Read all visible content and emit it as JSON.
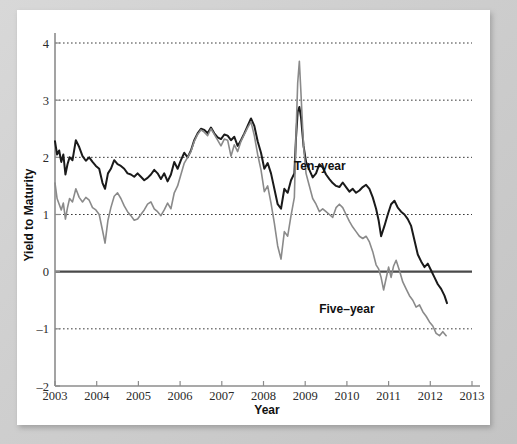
{
  "chart_data": {
    "type": "line",
    "title": "",
    "xlabel": "Year",
    "ylabel": "Yield to Maturity",
    "xlim": [
      2003,
      2013
    ],
    "ylim": [
      -2,
      4
    ],
    "grid": true,
    "gridlines_y": [
      4,
      3,
      2,
      1,
      -1
    ],
    "zero_line": 0,
    "legend_position": "inline-annotation",
    "xticks": [
      "2003",
      "2004",
      "2005",
      "2006",
      "2007",
      "2008",
      "2009",
      "2010",
      "2011",
      "2012",
      "2013"
    ],
    "xtick_values": [
      2003,
      2004,
      2005,
      2006,
      2007,
      2008,
      2009,
      2010,
      2011,
      2012,
      2013
    ],
    "yticks": [
      "4",
      "3",
      "2",
      "1",
      "0",
      "-1",
      "-2"
    ],
    "ytick_values": [
      4,
      3,
      2,
      1,
      0,
      -1,
      -2
    ],
    "series": [
      {
        "name": "Ten-year",
        "label": "Ten–year",
        "color": "#1a1a1a",
        "stroke_width": 2.0,
        "label_x": 2009.35,
        "label_y": 1.78,
        "x": [
          2003.0,
          2003.05,
          2003.1,
          2003.15,
          2003.2,
          2003.25,
          2003.3,
          2003.35,
          2003.42,
          2003.5,
          2003.58,
          2003.66,
          2003.74,
          2003.82,
          2003.9,
          2003.98,
          2004.06,
          2004.14,
          2004.2,
          2004.27,
          2004.34,
          2004.42,
          2004.5,
          2004.58,
          2004.66,
          2004.74,
          2004.82,
          2004.9,
          2004.98,
          2005.06,
          2005.14,
          2005.22,
          2005.3,
          2005.38,
          2005.46,
          2005.54,
          2005.62,
          2005.7,
          2005.78,
          2005.86,
          2005.94,
          2006.02,
          2006.1,
          2006.18,
          2006.26,
          2006.34,
          2006.42,
          2006.5,
          2006.58,
          2006.66,
          2006.74,
          2006.82,
          2006.9,
          2006.98,
          2007.06,
          2007.14,
          2007.22,
          2007.3,
          2007.38,
          2007.46,
          2007.54,
          2007.62,
          2007.7,
          2007.78,
          2007.86,
          2007.94,
          2008.02,
          2008.1,
          2008.18,
          2008.26,
          2008.34,
          2008.42,
          2008.5,
          2008.58,
          2008.66,
          2008.74,
          2008.78,
          2008.82,
          2008.86,
          2008.9,
          2008.96,
          2009.02,
          2009.1,
          2009.18,
          2009.26,
          2009.34,
          2009.42,
          2009.5,
          2009.58,
          2009.66,
          2009.74,
          2009.82,
          2009.9,
          2009.98,
          2010.06,
          2010.14,
          2010.22,
          2010.3,
          2010.38,
          2010.46,
          2010.54,
          2010.62,
          2010.7,
          2010.76,
          2010.82,
          2010.9,
          2010.98,
          2011.06,
          2011.14,
          2011.22,
          2011.3,
          2011.38,
          2011.46,
          2011.54,
          2011.62,
          2011.7,
          2011.78,
          2011.86,
          2011.94,
          2012.02,
          2012.1,
          2012.18,
          2012.26,
          2012.34,
          2012.4
        ],
        "y": [
          2.28,
          2.05,
          2.12,
          1.92,
          2.05,
          1.7,
          1.88,
          2.0,
          1.95,
          2.3,
          2.18,
          2.02,
          1.94,
          2.0,
          1.92,
          1.85,
          1.8,
          1.55,
          1.45,
          1.72,
          1.8,
          1.95,
          1.88,
          1.85,
          1.8,
          1.72,
          1.7,
          1.66,
          1.72,
          1.66,
          1.6,
          1.64,
          1.7,
          1.78,
          1.72,
          1.62,
          1.72,
          1.58,
          1.7,
          1.92,
          1.8,
          1.95,
          2.08,
          2.0,
          2.12,
          2.3,
          2.42,
          2.5,
          2.48,
          2.42,
          2.52,
          2.42,
          2.35,
          2.32,
          2.4,
          2.38,
          2.3,
          2.36,
          2.2,
          2.3,
          2.42,
          2.55,
          2.68,
          2.55,
          2.28,
          2.08,
          1.8,
          1.9,
          1.72,
          1.45,
          1.18,
          1.1,
          1.45,
          1.38,
          1.6,
          1.72,
          2.35,
          2.8,
          2.88,
          2.7,
          2.2,
          1.92,
          1.78,
          1.65,
          1.72,
          1.88,
          1.82,
          1.7,
          1.62,
          1.55,
          1.5,
          1.48,
          1.56,
          1.48,
          1.4,
          1.45,
          1.38,
          1.42,
          1.48,
          1.52,
          1.45,
          1.3,
          1.1,
          0.9,
          0.62,
          0.8,
          1.0,
          1.18,
          1.24,
          1.12,
          1.05,
          1.0,
          0.92,
          0.8,
          0.55,
          0.3,
          0.18,
          0.08,
          0.14,
          0.02,
          -0.1,
          -0.22,
          -0.3,
          -0.42,
          -0.55
        ]
      },
      {
        "name": "Five-year",
        "label": "Five–year",
        "color": "#8a8a8a",
        "stroke_width": 1.6,
        "label_x": 2010.0,
        "label_y": -0.72,
        "x": [
          2003.0,
          2003.05,
          2003.1,
          2003.15,
          2003.2,
          2003.25,
          2003.3,
          2003.35,
          2003.42,
          2003.5,
          2003.58,
          2003.66,
          2003.74,
          2003.82,
          2003.9,
          2003.98,
          2004.06,
          2004.14,
          2004.2,
          2004.27,
          2004.34,
          2004.42,
          2004.5,
          2004.58,
          2004.66,
          2004.74,
          2004.82,
          2004.9,
          2004.98,
          2005.06,
          2005.14,
          2005.22,
          2005.3,
          2005.38,
          2005.46,
          2005.54,
          2005.62,
          2005.7,
          2005.78,
          2005.86,
          2005.94,
          2006.02,
          2006.1,
          2006.18,
          2006.26,
          2006.34,
          2006.42,
          2006.5,
          2006.58,
          2006.66,
          2006.74,
          2006.82,
          2006.9,
          2006.98,
          2007.06,
          2007.14,
          2007.22,
          2007.3,
          2007.38,
          2007.46,
          2007.54,
          2007.62,
          2007.7,
          2007.78,
          2007.86,
          2007.94,
          2008.02,
          2008.1,
          2008.18,
          2008.26,
          2008.34,
          2008.42,
          2008.5,
          2008.58,
          2008.66,
          2008.74,
          2008.78,
          2008.82,
          2008.86,
          2008.9,
          2008.96,
          2009.02,
          2009.1,
          2009.18,
          2009.26,
          2009.34,
          2009.42,
          2009.5,
          2009.58,
          2009.66,
          2009.74,
          2009.82,
          2009.9,
          2009.98,
          2010.06,
          2010.14,
          2010.22,
          2010.3,
          2010.38,
          2010.46,
          2010.54,
          2010.62,
          2010.7,
          2010.76,
          2010.82,
          2010.88,
          2010.94,
          2011.0,
          2011.06,
          2011.12,
          2011.18,
          2011.26,
          2011.34,
          2011.42,
          2011.5,
          2011.58,
          2011.66,
          2011.74,
          2011.82,
          2011.9,
          2011.98,
          2012.06,
          2012.14,
          2012.22,
          2012.3,
          2012.38
        ],
        "y": [
          1.55,
          1.28,
          1.18,
          1.08,
          1.2,
          0.92,
          1.12,
          1.28,
          1.22,
          1.45,
          1.3,
          1.22,
          1.3,
          1.25,
          1.12,
          1.08,
          1.0,
          0.72,
          0.5,
          0.9,
          1.12,
          1.32,
          1.38,
          1.28,
          1.15,
          1.05,
          0.98,
          0.9,
          0.92,
          1.0,
          1.08,
          1.18,
          1.22,
          1.1,
          1.05,
          0.98,
          1.08,
          1.2,
          1.1,
          1.38,
          1.5,
          1.7,
          1.9,
          2.0,
          2.1,
          2.28,
          2.4,
          2.48,
          2.44,
          2.38,
          2.5,
          2.4,
          2.3,
          2.2,
          2.32,
          2.3,
          2.02,
          2.22,
          2.1,
          2.28,
          2.4,
          2.52,
          2.62,
          2.38,
          2.05,
          1.78,
          1.4,
          1.5,
          1.2,
          0.85,
          0.45,
          0.22,
          0.7,
          0.62,
          0.98,
          1.3,
          2.4,
          3.3,
          3.68,
          3.1,
          2.2,
          1.72,
          1.5,
          1.28,
          1.18,
          1.05,
          1.1,
          1.05,
          1.0,
          0.95,
          1.12,
          1.18,
          1.12,
          1.0,
          0.88,
          0.78,
          0.7,
          0.62,
          0.58,
          0.62,
          0.52,
          0.35,
          0.12,
          0.05,
          -0.1,
          -0.32,
          -0.12,
          0.08,
          -0.1,
          0.1,
          0.2,
          0.02,
          -0.18,
          -0.3,
          -0.42,
          -0.5,
          -0.62,
          -0.58,
          -0.7,
          -0.78,
          -0.88,
          -0.95,
          -1.08,
          -1.12,
          -1.05,
          -1.12
        ]
      }
    ]
  }
}
